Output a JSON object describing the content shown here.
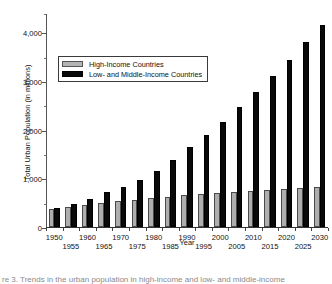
{
  "chart_data": {
    "type": "bar",
    "title": "",
    "xlabel": "Year",
    "ylabel": "Total Urban Population (in millions)",
    "categories": [
      "1950",
      "1955",
      "1960",
      "1965",
      "1970",
      "1975",
      "1980",
      "1985",
      "1990",
      "1995",
      "2000",
      "2005",
      "2010",
      "2015",
      "2020",
      "2025",
      "2030"
    ],
    "series": [
      {
        "name": "High-Income Countries",
        "color": "#aeaeae",
        "values": [
          370,
          410,
          455,
          495,
          535,
          565,
          595,
          620,
          650,
          675,
          700,
          725,
          745,
          765,
          785,
          805,
          830
        ]
      },
      {
        "name": "Low- and Middle-Income Countries",
        "color": "#090909",
        "values": [
          400,
          480,
          585,
          715,
          830,
          975,
          1160,
          1380,
          1640,
          1900,
          2165,
          2465,
          2770,
          3095,
          3440,
          3800,
          4150
        ]
      }
    ],
    "ylim": [
      0,
      4400
    ],
    "yticks": [
      0,
      1000,
      2000,
      3000,
      4000
    ],
    "ytick_labels": [
      "0",
      "1,000",
      "2,000",
      "3,000",
      "4,000"
    ],
    "yticks_minor": [
      500,
      1500,
      2500,
      3500,
      4400
    ],
    "grid": false,
    "legend_position": "upper-left-inside",
    "xtick_label_rows": 2
  },
  "legend": {
    "entries": [
      {
        "label": "High-Income Countries",
        "swatch": "high"
      },
      {
        "label": "Low- and Middle-Income Countries",
        "swatch": "lowmid"
      }
    ]
  },
  "caption": {
    "sliver_text": "re 3. Trends in the urban population in high-income and low- and middle-income"
  }
}
